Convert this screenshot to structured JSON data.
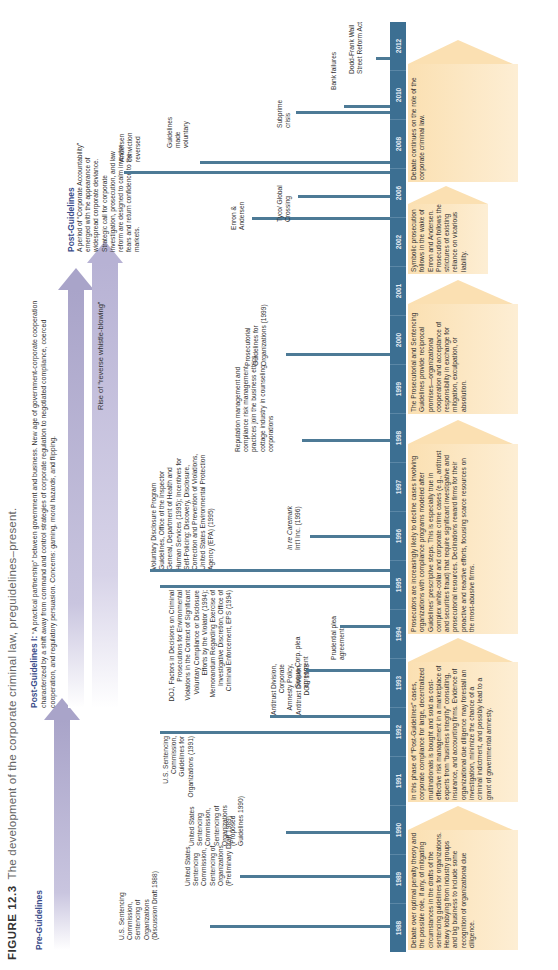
{
  "figure": {
    "number": "FIGURE 12.3",
    "caption": "The development of the corporate criminal law, preguidelines–present."
  },
  "phases": {
    "pre_guidelines": "Pre-Guidelines",
    "post_guidelines_1_title": "Post-Guidelines I:",
    "post_guidelines_1_text": "“A practical partnership” between government and business. New age of government-corporate cooperation characterized by a shift away from command and control strategies of corporate regulation to negotiated compliance, coerced cooperation, and regulatory persuasion. Concerns: gaming, moral hazards, and flipping.",
    "reverse_whistle": "Rise of “reverse whistle-blowing”",
    "post_guidelines_2_title": "Post-Guidelines",
    "post_guidelines_2_text": "A period of “Corporate Accountability” emerged with the appearance of widespread corporate deviance. Strategic call for corporate investigation, prosecution, and law reform are designed to calm investor fears and return confidence to the markets."
  },
  "years": [
    "1988",
    "1989",
    "1990",
    "1991",
    "1992",
    "1993",
    "1994",
    "1995",
    "1996",
    "1997",
    "1998",
    "1999",
    "2000",
    "2001",
    "2002",
    "2006",
    "2008",
    "2010",
    "2012"
  ],
  "events": {
    "e1988": "U.S. Sentencing Commission, Sentencing of Organizations (Discussion Draft 1988)",
    "e1989": "United States Sentencing Commission, Sentencing of Organizations (Preliminary Draft 1989)",
    "e1990": "United States Sentencing Commission, Sentencing of Organizations (Proposed Guidelines 1990)",
    "e1991": "U.S. Sentencing Commission, Guidelines for Organizations (1991)",
    "e1993_antitrust": "Antitrust Division, Corporate Amnesty Policy, Antitrust Division, DOJ, 1993",
    "e1993_sequa": "Sequa Corp. plea agreement",
    "e1994_prudential": "Prudential plea agreement",
    "e1994_doj": "DOJ, Factors in Decisions on Criminal Prosecutions for Environmental Violations in the Context of Significant Voluntary Compliance or Disclosure Efforts by the Violator (1994); Memorandum Regarding Exercise of Investigative Discretion, Office of Criminal Enforcement, EPS (1994)",
    "e1995": "Voluntary Disclosure Program Guidelines, Office of the Inspector General, Department of Health and Human Services (1995); Incentives for Self-Policing: Discovery, Disclosure, Correction and Prevention of Violations, United States Environmental Protection Agency (EPA) (1995)",
    "e1996_italic": "In re Caremark",
    "e1996_rest": "Int’l Inc. (1996)",
    "e1998": "Reputation management and compliance risk management practices join the business ethics cottage industry in counseling corporations",
    "e1999": "Prosecutorial Guidelines for Organizations (1999)",
    "e2002_enron": "Enron & Andersen",
    "e2002_tyco": "Tyco/ Global Crossing",
    "e2006_andersen": "Andersen conviction reversed",
    "e2006_guidelines": "Guidelines made voluntary",
    "e2008_subprime": "Subprime crisis",
    "e2008_bank": "Bank failures",
    "e2010": "Dodd-Frank Wall Street Reform Act"
  },
  "boxes": {
    "b1": "Debate over optimal penalty theory and the possible role, if any, of mitigating circumstances in the drafts of the sentencing guidelines for organizations. Heavy lobbying from industry groups and big business to include some recognition of organizational due diligence.",
    "b2": "In this phase of “Post-Guidelines” cases, corporate compliance for large, decentralized multinationals is bought and sold as cost-effective risk management in a marketplace of experts from “business integrity” consulting, insurance, and accounting firms. Evidence of organizational due diligence may forestall an investigation, minimize the chance of a criminal indictment, and possibly lead to a grant of governmental amnesty.",
    "b3": "Prosecutors are increasingly likely to decline cases involving organizations with compliance programs modeled after Guidelines’ prescriptive steps. This is especially true in complex white-collar and corporate crime cases (e.g., antitrust and securities fraud) that require significant investigative and prosecutorial resources. Declinations reward firms for their proactive and reactive efforts, focusing scarce resources on the most-abusive firms.",
    "b4": "The Prosecutorial and Sentencing Guidelines provide reciprocal promises—organizational cooperation and acceptance of responsibility in exchange for mitigation, exculpation, or absolution.",
    "b5": "Symbolic prosecution follows in the wake of Enron and Andersen. Prosecution follows the strictures of existing reliance on vicarious liability.",
    "b6": "Debate continues on the role of the corporate criminal law."
  },
  "colors": {
    "year_bar": "#3c6f92",
    "tick": "#4d7a96",
    "box_fill": "#fbe0b2",
    "arrow_purple": "#a9a4c9",
    "phase_label": "#3a4c8a"
  }
}
